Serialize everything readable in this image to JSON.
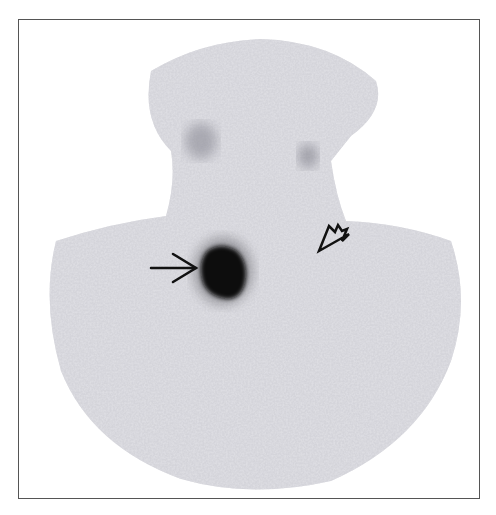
{
  "image": {
    "kind": "nuclear-medicine-scintigraphy",
    "description": "Grayscale planar scan of neck and upper chest with focal tracer uptake",
    "width": 496,
    "height": 515,
    "frame": {
      "x": 18,
      "y": 19,
      "width": 462,
      "height": 480,
      "border_color": "#555555"
    },
    "background_color": "#ffffff",
    "tissue_color": "#b8b8c0",
    "hotspot_color": "#0a0a0a",
    "annotations": [
      {
        "type": "arrow",
        "name": "focal-uptake-arrow",
        "direction": "right",
        "tail": [
          150,
          267
        ],
        "tip": [
          196,
          267
        ]
      },
      {
        "type": "arrowhead",
        "name": "open-arrowhead",
        "direction": "down-left",
        "tip": [
          318,
          250
        ]
      }
    ],
    "findings": [
      {
        "name": "hot-spot",
        "cx": 222,
        "cy": 268,
        "rx": 24,
        "ry": 28
      },
      {
        "name": "upper-uptake-left",
        "cx": 200,
        "cy": 140
      },
      {
        "name": "upper-uptake-right",
        "cx": 307,
        "cy": 155
      }
    ]
  }
}
